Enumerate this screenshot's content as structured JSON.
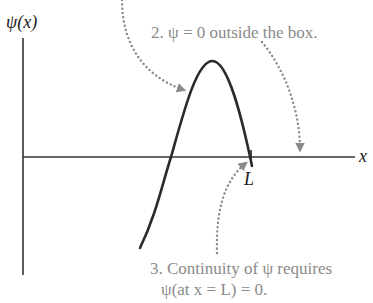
{
  "diagram": {
    "y_axis_label": "ψ(x)",
    "x_axis_label": "x",
    "boundary_label": "L",
    "notes": {
      "note2": "2. ψ = 0 outside the box.",
      "note3_line1": "3. Continuity of ψ requires",
      "note3_line2": "ψ(at x = L) = 0."
    },
    "colors": {
      "axis": "#333333",
      "curve": "#2a2a2a",
      "annotation_text": "#8a8a8a",
      "dotted_arrow": "#8a8a8a"
    },
    "curve": {
      "description": "wave function segment inside box rising through x-axis, peaking, then returning to zero at x = L",
      "points": [
        [
          140,
          248
        ],
        [
          171,
          157
        ],
        [
          212,
          61
        ],
        [
          250,
          157
        ],
        [
          252,
          166
        ]
      ]
    }
  }
}
